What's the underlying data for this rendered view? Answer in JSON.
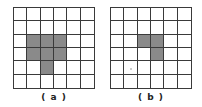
{
  "figure": {
    "panels": [
      {
        "label": "( a )",
        "rows": 6,
        "cols": 6,
        "filled_cells": [
          [
            2,
            1
          ],
          [
            2,
            2
          ],
          [
            2,
            3
          ],
          [
            3,
            1
          ],
          [
            3,
            2
          ],
          [
            3,
            3
          ],
          [
            4,
            2
          ]
        ],
        "fill_color": "#8a8a8a"
      },
      {
        "label": "( b )",
        "rows": 6,
        "cols": 6,
        "filled_cells": [
          [
            2,
            2
          ],
          [
            2,
            3
          ],
          [
            3,
            3
          ]
        ],
        "fill_color": "#8a8a8a"
      }
    ]
  }
}
